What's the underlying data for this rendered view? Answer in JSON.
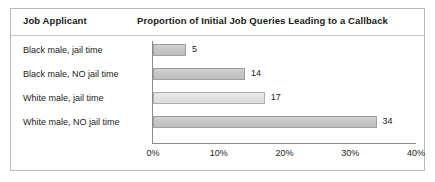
{
  "figure": {
    "column_header": "Job Applicant",
    "chart_title": "Proportion of Initial Job Queries Leading to a Callback"
  },
  "chart_data": {
    "type": "bar",
    "orientation": "horizontal",
    "title": "Proportion of Initial Job Queries Leading to a Callback",
    "xlabel": "",
    "ylabel": "Job Applicant",
    "categories": [
      "Black male, jail time",
      "Black male, NO jail time",
      "White male, jail time",
      "White male, NO jail time"
    ],
    "values": [
      5,
      14,
      17,
      34
    ],
    "value_labels": [
      "5",
      "14",
      "17",
      "34"
    ],
    "unit": "%",
    "xlim": [
      0,
      40
    ],
    "xticks": [
      0,
      10,
      20,
      30,
      40
    ],
    "xtick_labels": [
      "0%",
      "10%",
      "20%",
      "30%",
      "40%"
    ],
    "grid": false,
    "legend": false,
    "bar_colors": [
      "#c6c6c6",
      "#c6c6c6",
      "#e2e2e2",
      "#c6c6c6"
    ]
  }
}
